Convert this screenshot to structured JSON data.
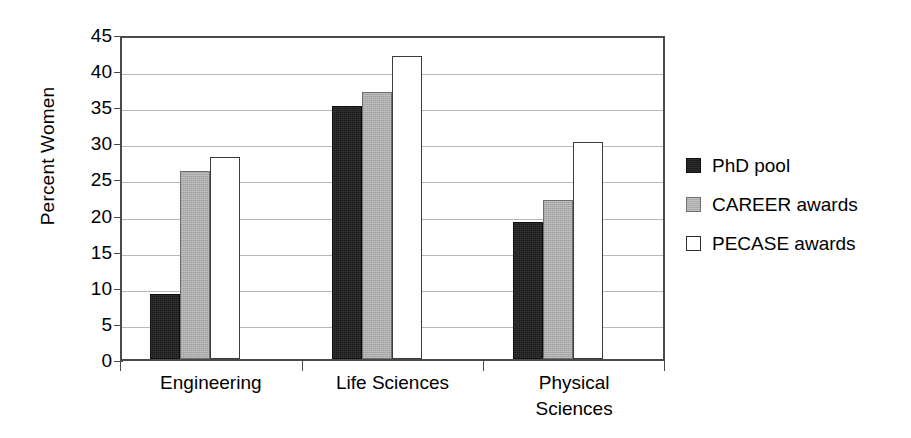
{
  "chart_data": {
    "type": "bar",
    "title": "",
    "xlabel": "",
    "ylabel": "Percent Women",
    "categories": [
      "Engineering",
      "Life Sciences",
      "Physical Sciences"
    ],
    "category_lines": [
      [
        "Engineering"
      ],
      [
        "Life Sciences"
      ],
      [
        "Physical",
        "Sciences"
      ]
    ],
    "series": [
      {
        "name": "PhD pool",
        "values": [
          9,
          35,
          19
        ],
        "color": "#1c1c1c"
      },
      {
        "name": "CAREER awards",
        "values": [
          26,
          37,
          22
        ],
        "color": "#ababab"
      },
      {
        "name": "PECASE awards",
        "values": [
          28,
          42,
          30
        ],
        "color": "#ffffff"
      }
    ],
    "ylim": [
      0,
      45
    ],
    "ytick_values": [
      0,
      5,
      10,
      15,
      20,
      25,
      30,
      35,
      40,
      45
    ],
    "ytick_labels": [
      "0",
      "5",
      "10",
      "15",
      "20",
      "25",
      "30",
      "35",
      "40",
      "45"
    ],
    "grid": true,
    "grid_axis": "y",
    "legend_position": "right",
    "frame_color": "#4a4a4a",
    "gridline_color": "#b9b9b9",
    "background": "#ffffff"
  }
}
